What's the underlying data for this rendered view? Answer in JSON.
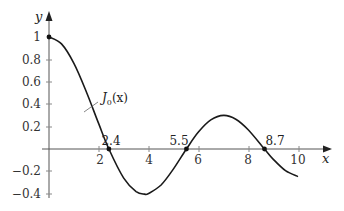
{
  "chart_data": {
    "type": "line",
    "title": "",
    "xlabel": "x",
    "ylabel": "y",
    "xlim": [
      0,
      10.5
    ],
    "ylim": [
      -0.42,
      1.1
    ],
    "grid": false,
    "x_ticks": [
      "2",
      "4",
      "6",
      "8",
      "10"
    ],
    "y_ticks": [
      "1",
      "0.8",
      "0.6",
      "0.4",
      "0.2",
      "−0.2",
      "−0.4"
    ],
    "series": [
      {
        "name": "J0(x)",
        "label": "J",
        "label_sub": "0",
        "label_tail": "(x)",
        "x": [
          0,
          0.5,
          1,
          1.5,
          2,
          2.405,
          3,
          3.5,
          3.832,
          4,
          4.5,
          5,
          5.52,
          6,
          6.5,
          7.016,
          7.5,
          8,
          8.654,
          9,
          9.5,
          10.0
        ],
        "y": [
          1.0,
          0.938,
          0.765,
          0.512,
          0.224,
          0.0,
          -0.26,
          -0.38,
          -0.403,
          -0.397,
          -0.321,
          -0.178,
          0.0,
          0.151,
          0.26,
          0.3,
          0.266,
          0.172,
          0.0,
          -0.09,
          -0.194,
          -0.246
        ]
      }
    ],
    "annotations": [
      {
        "text": "2.4",
        "x": 2.405,
        "y": 0
      },
      {
        "text": "5.5",
        "x": 5.52,
        "y": 0
      },
      {
        "text": "8.7",
        "x": 8.654,
        "y": 0
      }
    ],
    "marked_points": [
      {
        "x": 0,
        "y": 1
      },
      {
        "x": 2.405,
        "y": 0
      },
      {
        "x": 5.52,
        "y": 0
      },
      {
        "x": 8.654,
        "y": 0
      }
    ],
    "colors": {
      "curve": "#1a1a1a",
      "axis": "#555555",
      "text": "#333333"
    }
  }
}
